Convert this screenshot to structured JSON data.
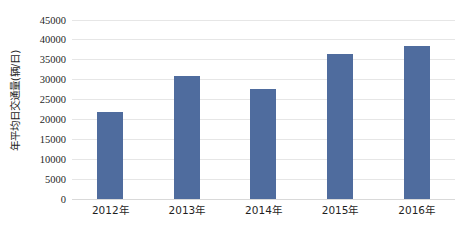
{
  "chart_data": {
    "type": "bar",
    "title": "",
    "subtitle": "",
    "xlabel": "",
    "ylabel": "年平均日交通量(辆/日)",
    "categories": [
      "2012年",
      "2013年",
      "2014年",
      "2015年",
      "2016年"
    ],
    "values": [
      21800,
      30800,
      27600,
      36300,
      38400
    ],
    "series": [
      {
        "name": "年平均日交通量",
        "values": [
          21800,
          30800,
          27600,
          36300,
          38400
        ]
      }
    ],
    "ylim": [
      0,
      45000
    ],
    "y_tick_step": 5000,
    "y_ticks": [
      45000,
      40000,
      35000,
      30000,
      25000,
      20000,
      15000,
      10000,
      5000,
      0
    ],
    "y_tick_labels": [
      "45000",
      "40000",
      "35000",
      "30000",
      "25000",
      "20000",
      "15000",
      "10000",
      "5000",
      "0"
    ],
    "grid": true,
    "grid_axis": "y",
    "legend": false,
    "legend_position": "none",
    "bar_color": "#4f6c9e",
    "grid_color": "#e6e6e6",
    "background_color": "#ffffff",
    "axis_text_color": "#1f1f1f"
  }
}
